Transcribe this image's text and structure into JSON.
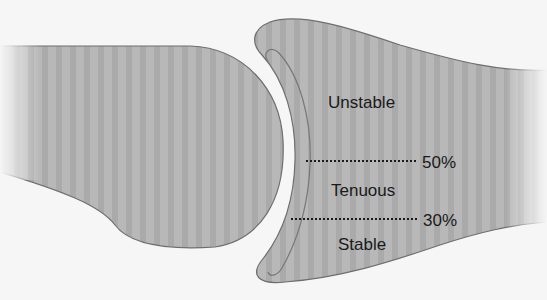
{
  "diagram": {
    "zones": [
      {
        "label": "Unstable"
      },
      {
        "label": "Tenuous"
      },
      {
        "label": "Stable"
      }
    ],
    "thresholds": [
      {
        "label": "50%"
      },
      {
        "label": "30%"
      }
    ],
    "colors": {
      "background": "#f6f6f6",
      "bone_fill": "#b4b4b4",
      "bone_outline": "#6e6e6e",
      "dotted_line": "#1a1a1a",
      "text": "#1a1a1a"
    }
  }
}
